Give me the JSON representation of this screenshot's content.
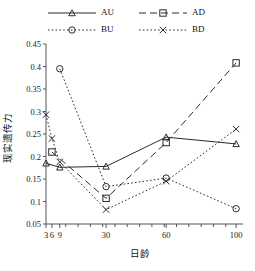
{
  "chart_data": {
    "type": "line",
    "title": "",
    "xlabel": "日龄",
    "ylabel": "现实遗传力",
    "x": [
      3,
      6,
      9,
      30,
      60,
      100
    ],
    "xtick_labels": [
      "3",
      "6",
      "9",
      "30",
      "60",
      "100"
    ],
    "ytick_labels": [
      "0.05",
      "0.1",
      "0.15",
      "0.2",
      "0.25",
      "0.3",
      "0.35",
      "0.4",
      "0.45"
    ],
    "ytick_values": [
      0.05,
      0.1,
      0.15,
      0.2,
      0.25,
      0.3,
      0.35,
      0.4,
      0.45
    ],
    "ylim": [
      0.05,
      0.45
    ],
    "grid": false,
    "legend_position": "top",
    "series": [
      {
        "name": "AU",
        "marker": "triangle",
        "line_style": "solid",
        "color": "#2b2b2b",
        "points": [
          {
            "x": 3,
            "y": 0.185
          },
          {
            "x": 9,
            "y": 0.176
          },
          {
            "x": 30,
            "y": 0.178
          },
          {
            "x": 60,
            "y": 0.243
          },
          {
            "x": 100,
            "y": 0.228
          }
        ]
      },
      {
        "name": "AD",
        "marker": "square",
        "line_style": "dashed",
        "color": "#2b2b2b",
        "points": [
          {
            "x": 6,
            "y": 0.21
          },
          {
            "x": 30,
            "y": 0.107
          },
          {
            "x": 60,
            "y": 0.231
          },
          {
            "x": 100,
            "y": 0.408
          }
        ]
      },
      {
        "name": "BU",
        "marker": "circle",
        "line_style": "dotted",
        "color": "#2b2b2b",
        "points": [
          {
            "x": 9,
            "y": 0.395
          },
          {
            "x": 30,
            "y": 0.133
          },
          {
            "x": 60,
            "y": 0.152
          },
          {
            "x": 100,
            "y": 0.084
          }
        ]
      },
      {
        "name": "BD",
        "marker": "cross",
        "line_style": "dotted",
        "color": "#2b2b2b",
        "points": [
          {
            "x": 3,
            "y": 0.293
          },
          {
            "x": 6,
            "y": 0.24
          },
          {
            "x": 9,
            "y": 0.188
          },
          {
            "x": 30,
            "y": 0.082
          },
          {
            "x": 60,
            "y": 0.145
          },
          {
            "x": 100,
            "y": 0.261
          }
        ]
      }
    ]
  },
  "legend": {
    "entries": [
      {
        "label": "AU",
        "marker": "triangle",
        "line_style": "solid"
      },
      {
        "label": "AD",
        "marker": "square",
        "line_style": "dashed"
      },
      {
        "label": "BU",
        "marker": "circle",
        "line_style": "dotted"
      },
      {
        "label": "BD",
        "marker": "cross",
        "line_style": "dotted"
      }
    ]
  }
}
